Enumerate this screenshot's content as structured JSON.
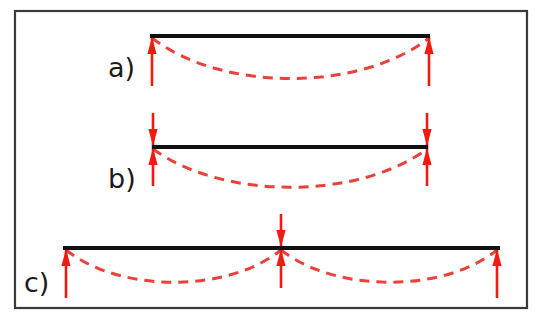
{
  "figure": {
    "background_color": "#ffffff",
    "frame": {
      "name": "figure-border",
      "color": "#3a3a3a",
      "x": 15,
      "y": 11,
      "width": 512,
      "height": 297,
      "stroke_width": 2.2
    },
    "beam_color": "#111111",
    "support_color": "#f01a10",
    "deflection_color": "#e8423a",
    "deflection_dash": "10 7"
  },
  "cases": [
    {
      "id": "a",
      "label": "a)",
      "label_x": 108,
      "label_y": 77,
      "description": "Simply supported beam with upward reactions at both ends",
      "beam": {
        "x1": 150,
        "y1": 36,
        "x2": 430,
        "y2": 36,
        "stroke_width": 4
      },
      "supports": [
        {
          "name": "support-left",
          "type": "single-up-arrow",
          "x": 152,
          "tip_y": 36,
          "tail_y": 86
        },
        {
          "name": "support-right",
          "type": "single-up-arrow",
          "x": 429,
          "tip_y": 36,
          "tail_y": 86
        }
      ],
      "deflection": {
        "name": "deflection-curve",
        "path": "M 152 38 C 222 92, 360 92, 429 38",
        "spans": 1
      }
    },
    {
      "id": "b",
      "label": "b)",
      "label_x": 108,
      "label_y": 188,
      "description": "Beam with clamped (fixed) supports shown as double-headed arrows at both ends",
      "beam": {
        "x1": 152,
        "y1": 147,
        "x2": 428,
        "y2": 147,
        "stroke_width": 4
      },
      "supports": [
        {
          "name": "support-left",
          "type": "double-arrow",
          "x": 153,
          "center_y": 147,
          "top_y": 113,
          "bottom_y": 186
        },
        {
          "name": "support-right",
          "type": "double-arrow",
          "x": 427,
          "center_y": 147,
          "top_y": 113,
          "bottom_y": 186
        }
      ],
      "deflection": {
        "name": "deflection-curve",
        "path": "M 153 149 C 223 200, 358 200, 427 149",
        "spans": 1
      }
    },
    {
      "id": "c",
      "label": "c)",
      "label_x": 24,
      "label_y": 292,
      "description": "Two-span continuous beam with end reactions and a central double-headed support",
      "beam": {
        "x1": 63,
        "y1": 248,
        "x2": 500,
        "y2": 248,
        "stroke_width": 4
      },
      "supports": [
        {
          "name": "support-left",
          "type": "single-up-arrow",
          "x": 66,
          "tip_y": 248,
          "tail_y": 298
        },
        {
          "name": "support-middle",
          "type": "double-arrow",
          "x": 281,
          "center_y": 248,
          "top_y": 214,
          "bottom_y": 288
        },
        {
          "name": "support-right",
          "type": "single-up-arrow",
          "x": 497,
          "tip_y": 248,
          "tail_y": 298
        }
      ],
      "deflection": {
        "name": "deflection-curve",
        "path": "M 66 250 C 120 293, 228 293, 281 250 M 281 250 C 336 293, 444 293, 497 250",
        "spans": 2
      }
    }
  ]
}
